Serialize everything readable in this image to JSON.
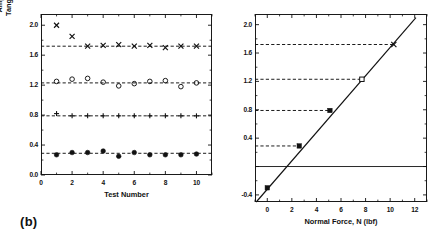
{
  "figure": {
    "panel_tag": "(b)"
  },
  "left_panel": {
    "ylabel_line1": "Amplitude of Dynamic",
    "ylabel_line2": "Tangential Force, Tʹ (lbf)",
    "xlabel": "Test Number",
    "yticks": [
      "0.0",
      "0.4",
      "0.8",
      "1.2",
      "1.6",
      "2.0"
    ],
    "xticks": [
      "0",
      "2",
      "4",
      "6",
      "8",
      "10"
    ]
  },
  "right_panel": {
    "xlabel": "Normal Force, N (lbf)",
    "yticks": [
      "-0.4",
      "0.4",
      "0.8",
      "1.2",
      "1.6",
      "2.0"
    ],
    "xticks": [
      "0",
      "2",
      "4",
      "6",
      "8",
      "10",
      "12"
    ]
  },
  "chart_data": [
    {
      "type": "scatter",
      "title": "Amplitude of dynamic tangential force per test",
      "xlabel": "Test Number",
      "ylabel": "Amplitude of Dynamic Tangential Force, Tʹ (lbf)",
      "xlim": [
        0,
        11
      ],
      "ylim": [
        0.0,
        2.15
      ],
      "xticks": [
        0,
        2,
        4,
        6,
        8,
        10
      ],
      "yticks": [
        0.0,
        0.4,
        0.8,
        1.2,
        1.6,
        2.0
      ],
      "grid": false,
      "legend": "none",
      "x": [
        1,
        2,
        3,
        4,
        5,
        6,
        7,
        8,
        9,
        10
      ],
      "series": [
        {
          "name": "N = 10.3 lbf",
          "marker": "x",
          "mean_line": 1.72,
          "values": [
            2.0,
            1.85,
            1.72,
            1.73,
            1.74,
            1.72,
            1.73,
            1.7,
            1.72,
            1.72
          ]
        },
        {
          "name": "N = 7.7 lbf",
          "marker": "open-circle",
          "mean_line": 1.23,
          "values": [
            1.25,
            1.28,
            1.29,
            1.24,
            1.19,
            1.22,
            1.25,
            1.26,
            1.18,
            1.23
          ]
        },
        {
          "name": "N = 5.1 lbf",
          "marker": "plus",
          "mean_line": 0.79,
          "values": [
            0.82,
            0.79,
            0.79,
            0.79,
            0.79,
            0.79,
            0.79,
            0.79,
            0.79,
            0.79
          ]
        },
        {
          "name": "N = 2.6 lbf",
          "marker": "filled-circle",
          "mean_line": 0.29,
          "values": [
            0.27,
            0.3,
            0.3,
            0.32,
            0.25,
            0.3,
            0.27,
            0.27,
            0.27,
            0.28
          ]
        }
      ]
    },
    {
      "type": "scatter",
      "title": "Mean tangential force amplitude vs normal force with linear fit",
      "xlabel": "Normal Force, N (lbf)",
      "ylabel": "Amplitude of Dynamic Tangential Force, Tʹ (lbf)",
      "xlim": [
        -1,
        13
      ],
      "ylim": [
        -0.5,
        2.15
      ],
      "xticks": [
        0,
        2,
        4,
        6,
        8,
        10,
        12
      ],
      "yticks": [
        -0.4,
        0.0,
        0.4,
        0.8,
        1.2,
        1.6,
        2.0
      ],
      "grid": false,
      "legend": "none",
      "points": [
        {
          "x": 0.0,
          "y": -0.3,
          "marker": "filled-square"
        },
        {
          "x": 2.6,
          "y": 0.29,
          "marker": "filled-square"
        },
        {
          "x": 5.1,
          "y": 0.79,
          "marker": "filled-square"
        },
        {
          "x": 7.7,
          "y": 1.23,
          "marker": "open-square"
        },
        {
          "x": 10.3,
          "y": 1.72,
          "marker": "x"
        }
      ],
      "fit_line": {
        "x0": -0.9,
        "y0": -0.5,
        "x1": 12.1,
        "y1": 2.1
      },
      "zero_line_y": 0.0,
      "dashed_levels": [
        0.29,
        0.79,
        1.23,
        1.72
      ]
    }
  ]
}
